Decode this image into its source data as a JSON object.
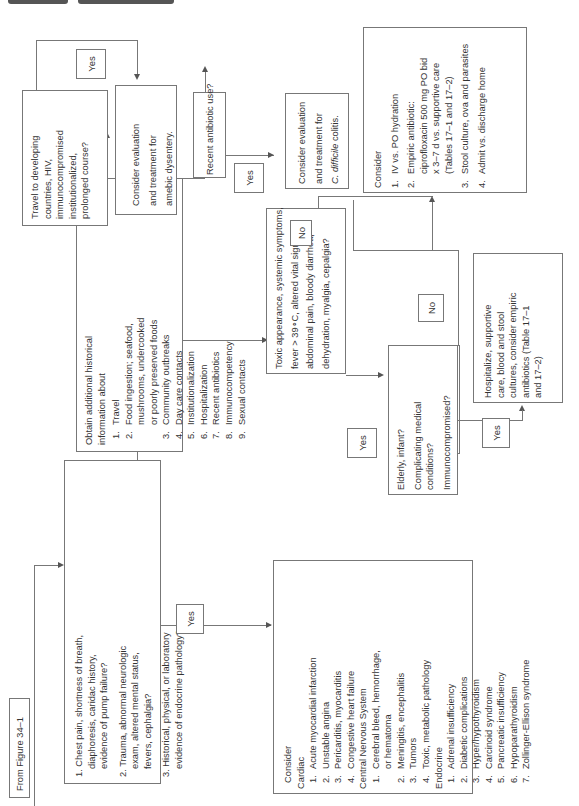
{
  "header": {
    "tabs": [
      "",
      ""
    ]
  },
  "start": {
    "label": "From Figure 34–1"
  },
  "initial_questions": {
    "items": [
      "1. Chest pain, shortness of breath,",
      "diaphoresis, caridac history,",
      "evidence of pump failure?",
      "2. Trauma, abnormal neurologic",
      "exam, altered mental status,",
      "fevers, cephalgia?",
      "3. Historical, physical, or laboratory",
      "evidence of endocrine pathology?"
    ]
  },
  "labels": {
    "yes_initial": "Yes",
    "no_initial": "No",
    "yes_travel": "Yes",
    "yes_antibiotic": "Yes",
    "no_toxic": "No",
    "yes_toxic": "Yes",
    "no_elderly": "No",
    "yes_elderly": "Yes"
  },
  "consider_differential": {
    "title": "Consider",
    "groups": [
      {
        "name": "Cardiac",
        "items": [
          "Acute myocardial infarction",
          "Unstable angina",
          "Pericarditis, myocarditis",
          "Congestive heart failure"
        ]
      },
      {
        "name": "Central Nervous System",
        "items": [
          "Cerebral bleed, hemorrhage,|or hematoma",
          "Meningitis, encephalitis",
          "Tumors",
          "Toxic, metabolic pathology"
        ]
      },
      {
        "name": "Endocrine",
        "items": [
          "Adrenal insufficiency",
          "Diabetic complications",
          "Hyper/hypothyroidism",
          "Carcinoid syndrome",
          "Pancreatic insufficiency",
          "Hypoparathyroidism",
          "Zollinger-Ellison syndrome"
        ]
      }
    ]
  },
  "history": {
    "intro": [
      "Obtain additional historical",
      "information about"
    ],
    "items": [
      "Travel",
      "Food ingestion; seafood,|mushrooms, undercooked|or poorly preserved foods",
      "Community outbreaks",
      "Day care contacts",
      "Institutionalization",
      "Hospitalization",
      "Recent antibiotics",
      "Immunocompetency",
      "Sexual contacts"
    ]
  },
  "travel": {
    "lines": [
      "Travel to developing",
      "countries, HIV,",
      "immunocompromised",
      "institutionalized,",
      "prolonged course?"
    ]
  },
  "amebic": {
    "lines": [
      "Consider evaluation",
      "and treatment for",
      "amebic dysentery."
    ]
  },
  "antibiotic": {
    "lines": [
      "Recent antibiotic use?"
    ]
  },
  "cdiff": {
    "lines": [
      "Consider evaluation",
      "and treatment for"
    ],
    "italic": "C. difficile",
    "tail": " colitis."
  },
  "toxic": {
    "lines": [
      "Toxic appearance, systemic symptoms,",
      "fever > 39∘C, altered vital signs,",
      "abdominal pain, bloody diarrhea,",
      "dehydration, myalgia, cepalgia?"
    ]
  },
  "elderly": {
    "lines": [
      "Elderly, infant?",
      "Complicating medical|conditions?",
      "Immunocompromised?"
    ]
  },
  "hospitalize": {
    "lines": [
      "Hospitalize, supportive",
      "care, blood and stool",
      "cultures, consider empiric",
      "antibiotics (Table 17–1",
      "and 17–2)"
    ]
  },
  "consider_outpatient": {
    "title": "Consider",
    "items": [
      "IV vs. PO hydration",
      "Empiric antibiotic:|ciprofloxacin 500 mg PO bid|x 3–7 d vs. supportive care|(Tables 17–1 and 17–2)",
      "Stool culture, ova and parasites",
      "Admit vs. discharge home"
    ]
  }
}
